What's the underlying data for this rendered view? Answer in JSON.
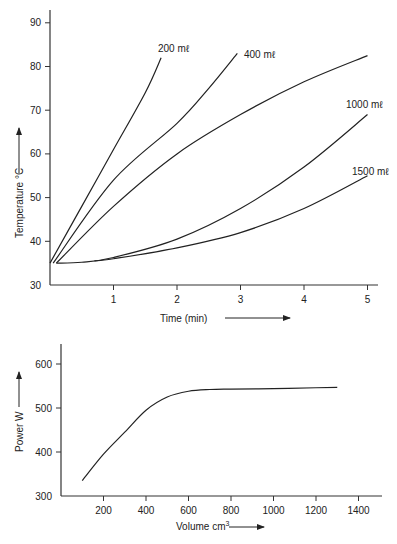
{
  "chart_data": [
    {
      "type": "line",
      "title": "",
      "xlabel": "Time (min)",
      "ylabel": "Temperature °C",
      "xlim": [
        0,
        5.2
      ],
      "ylim": [
        30,
        93
      ],
      "xticks": [
        1,
        2,
        3,
        4,
        5
      ],
      "yticks": [
        30,
        40,
        50,
        60,
        70,
        80,
        90
      ],
      "grid": false,
      "legend": "inline labels at curve ends",
      "series": [
        {
          "name": "200 mℓ",
          "x": [
            0.0,
            0.5,
            1.0,
            1.5,
            1.75
          ],
          "y": [
            35,
            48,
            61,
            74,
            82
          ]
        },
        {
          "name": "400 mℓ",
          "x": [
            0.05,
            1.0,
            2.0,
            2.5,
            2.95
          ],
          "y": [
            35,
            54,
            67,
            75,
            83
          ]
        },
        {
          "name": "",
          "x": [
            0.1,
            1.0,
            2.0,
            3.0,
            4.0,
            5.0
          ],
          "y": [
            35,
            48,
            60,
            69,
            76.5,
            82.5
          ]
        },
        {
          "name": "1000 mℓ",
          "x": [
            0.1,
            0.5,
            1.0,
            2.0,
            3.0,
            4.0,
            5.0
          ],
          "y": [
            35,
            35.2,
            36.3,
            40.5,
            47.5,
            57,
            69
          ]
        },
        {
          "name": "1500 mℓ",
          "x": [
            0.7,
            1.0,
            2.0,
            3.0,
            4.0,
            5.0
          ],
          "y": [
            35.5,
            36,
            38.5,
            42,
            47.5,
            55
          ]
        }
      ]
    },
    {
      "type": "line",
      "title": "",
      "xlabel": "Volume cm³",
      "ylabel": "Power W",
      "xlim": [
        0,
        1500
      ],
      "ylim": [
        300,
        650
      ],
      "xticks": [
        200,
        400,
        600,
        800,
        1000,
        1200,
        1400
      ],
      "yticks": [
        300,
        400,
        500,
        600
      ],
      "grid": false,
      "series": [
        {
          "name": "Power",
          "x": [
            100,
            200,
            300,
            400,
            500,
            600,
            700,
            800,
            1000,
            1200,
            1300
          ],
          "y": [
            335,
            395,
            445,
            495,
            525,
            538,
            542,
            543,
            544,
            546,
            547
          ]
        }
      ]
    }
  ],
  "labels": {
    "top": {
      "ylabel": "Temperature °C",
      "xlabel": "Time (min)",
      "series_labels": [
        "200 mℓ",
        "400 mℓ",
        "1000 mℓ",
        "1500 mℓ"
      ]
    },
    "bottom": {
      "ylabel": "Power W",
      "xlabel": "Volume cm",
      "xlabel_sup": "3"
    }
  }
}
